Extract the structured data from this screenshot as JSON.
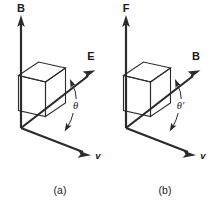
{
  "figure": {
    "background_color": "#ffffff",
    "stroke_color": "#2b2b2b",
    "text_color": "#1a1a1a",
    "width": 217,
    "height": 208
  },
  "panels": [
    {
      "id": "panel-a",
      "caption": "(a)",
      "vertical_vector_label": "B",
      "diagonal_vector_label": "E",
      "velocity_vector_label": "v",
      "angle_label": "θ"
    },
    {
      "id": "panel-b",
      "caption": "(b)",
      "vertical_vector_label": "F",
      "diagonal_vector_label": "B",
      "velocity_vector_label": "v",
      "angle_label": "θ′"
    }
  ]
}
